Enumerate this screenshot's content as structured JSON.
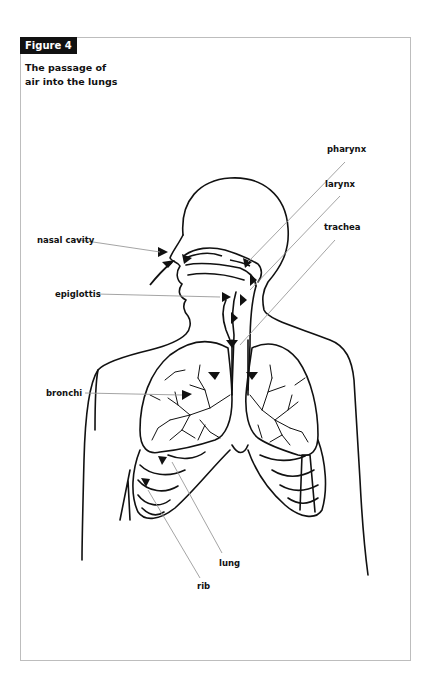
{
  "figure": {
    "badge": "Figure 4",
    "title_line1": "The passage of",
    "title_line2": "air into the lungs"
  },
  "labels": {
    "pharynx": "pharynx",
    "larynx": "larynx",
    "trachea": "trachea",
    "nasal_cavity": "nasal cavity",
    "epiglottis": "epiglottis",
    "bronchi": "bronchi",
    "lung": "lung",
    "rib": "rib"
  },
  "colors": {
    "badge_bg": "#111111",
    "badge_text": "#ffffff",
    "leader_line": "#9a9a9a",
    "frame": "#bdbdbd",
    "ink": "#111111"
  }
}
